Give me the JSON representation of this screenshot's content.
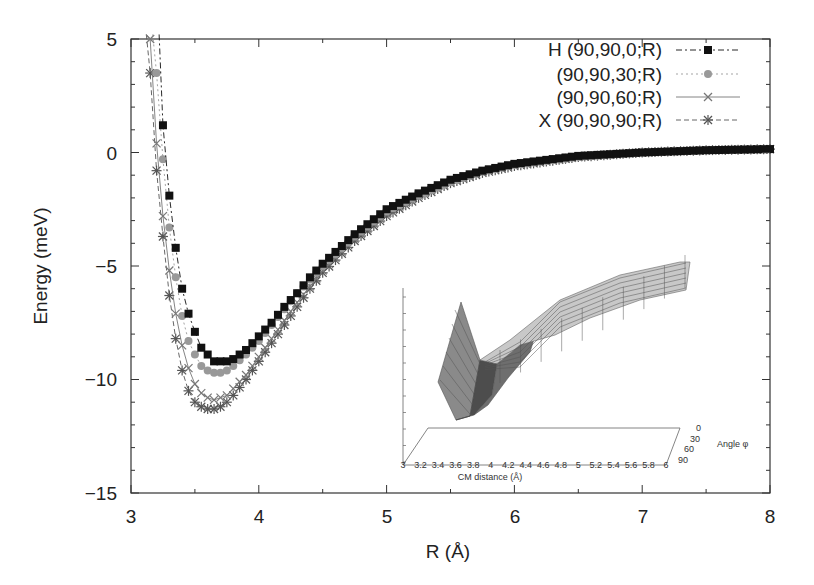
{
  "chart_data": {
    "type": "line",
    "title": "",
    "xlabel": "R (Å)",
    "ylabel": "Energy (meV)",
    "xlim": [
      3,
      8
    ],
    "ylim": [
      -15,
      5
    ],
    "xticks": [
      "3",
      "4",
      "5",
      "6",
      "7",
      "8"
    ],
    "yticks": [
      "5",
      "0",
      "−5",
      "−10",
      "−15"
    ],
    "grid": false,
    "legend_position": "upper right",
    "series": [
      {
        "name": "H (90,90,0;R)",
        "marker": "filled-square",
        "line": "dash-dot",
        "color": "#111111",
        "x": [
          3.25,
          3.3,
          3.35,
          3.4,
          3.45,
          3.5,
          3.55,
          3.6,
          3.65,
          3.7,
          3.75,
          3.8,
          3.9,
          4.0,
          4.1,
          4.2,
          4.3,
          4.4,
          4.5,
          4.75,
          5.0,
          5.25,
          5.5,
          5.75,
          6.0,
          6.5,
          7.0,
          7.5,
          8.0
        ],
        "values": [
          1.2,
          -1.9,
          -4.2,
          -6.0,
          -7.1,
          -7.9,
          -8.6,
          -8.9,
          -9.2,
          -9.2,
          -9.2,
          -9.1,
          -8.7,
          -8.1,
          -7.5,
          -6.8,
          -6.2,
          -5.5,
          -4.9,
          -3.6,
          -2.5,
          -1.8,
          -1.2,
          -0.8,
          -0.5,
          -0.15,
          0.0,
          0.1,
          0.15
        ]
      },
      {
        "name": "(90,90,30;R)",
        "marker": "filled-circle",
        "line": "dotted",
        "color": "#999999",
        "x": [
          3.2,
          3.25,
          3.3,
          3.35,
          3.4,
          3.45,
          3.5,
          3.55,
          3.6,
          3.65,
          3.7,
          3.75,
          3.8,
          3.9,
          4.0,
          4.1,
          4.2,
          4.3,
          4.4,
          4.5,
          4.75,
          5.0,
          5.25,
          5.5,
          5.75,
          6.0,
          6.5,
          7.0,
          7.5,
          8.0
        ],
        "values": [
          3.5,
          -0.3,
          -3.3,
          -5.5,
          -7.2,
          -8.3,
          -8.9,
          -9.4,
          -9.6,
          -9.7,
          -9.7,
          -9.6,
          -9.4,
          -8.9,
          -8.3,
          -7.6,
          -6.9,
          -6.2,
          -5.6,
          -5.0,
          -3.7,
          -2.6,
          -1.9,
          -1.3,
          -0.85,
          -0.55,
          -0.2,
          0.0,
          0.1,
          0.15
        ]
      },
      {
        "name": "(90,90,60;R)",
        "marker": "cross",
        "line": "solid",
        "color": "#777777",
        "x": [
          3.15,
          3.2,
          3.25,
          3.3,
          3.35,
          3.4,
          3.45,
          3.5,
          3.55,
          3.6,
          3.65,
          3.7,
          3.75,
          3.8,
          3.9,
          4.0,
          4.1,
          4.2,
          4.3,
          4.4,
          4.5,
          4.75,
          5.0,
          5.25,
          5.5,
          5.75,
          6.0,
          6.5,
          7.0,
          7.5,
          8.0
        ],
        "values": [
          5.0,
          0.4,
          -2.8,
          -5.2,
          -7.1,
          -8.5,
          -9.5,
          -10.2,
          -10.6,
          -10.8,
          -10.9,
          -10.8,
          -10.7,
          -10.4,
          -9.8,
          -9.0,
          -8.2,
          -7.4,
          -6.6,
          -5.9,
          -5.2,
          -3.8,
          -2.7,
          -1.9,
          -1.3,
          -0.85,
          -0.55,
          -0.2,
          0.0,
          0.1,
          0.15
        ]
      },
      {
        "name": "X (90,90,90;R)",
        "marker": "asterisk",
        "line": "dashed",
        "color": "#555555",
        "x": [
          3.15,
          3.2,
          3.25,
          3.3,
          3.35,
          3.4,
          3.45,
          3.5,
          3.55,
          3.6,
          3.65,
          3.7,
          3.75,
          3.8,
          3.9,
          4.0,
          4.1,
          4.2,
          4.3,
          4.4,
          4.5,
          4.75,
          5.0,
          5.25,
          5.5,
          5.75,
          6.0,
          6.5,
          7.0,
          7.5,
          8.0
        ],
        "values": [
          3.5,
          -0.8,
          -3.7,
          -6.3,
          -8.2,
          -9.6,
          -10.5,
          -11.0,
          -11.2,
          -11.3,
          -11.3,
          -11.2,
          -11.0,
          -10.7,
          -10.0,
          -9.2,
          -8.4,
          -7.6,
          -6.8,
          -6.0,
          -5.3,
          -3.9,
          -2.8,
          -2.0,
          -1.35,
          -0.9,
          -0.6,
          -0.2,
          0.0,
          0.1,
          0.15
        ]
      }
    ],
    "inset": {
      "type": "surface3d",
      "xlabel": "CM distance (Å)",
      "ylabel": "Angle φ",
      "xticks": [
        "3",
        "3.2",
        "3.4",
        "3.6",
        "3.8",
        "4",
        "4.2",
        "4.4",
        "4.6",
        "4.8",
        "5",
        "5.2",
        "5.4",
        "5.6",
        "5.8",
        "6"
      ],
      "yticks": [
        "0",
        "30",
        "60",
        "90"
      ]
    }
  }
}
